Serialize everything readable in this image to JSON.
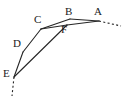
{
  "figure": {
    "background_color": "#ffffff",
    "stroke_color": "#262626",
    "label_color": "#1a1a1a",
    "stroke_width": 1.1,
    "viewbox": "0 0 125 99"
  },
  "vertices": [
    {
      "id": "A",
      "label": "A",
      "x": 99,
      "y": 21,
      "label_x": 94,
      "label_y": 6
    },
    {
      "id": "B",
      "label": "B",
      "x": 70,
      "y": 19,
      "label_x": 65,
      "label_y": 6
    },
    {
      "id": "C",
      "label": "C",
      "x": 41,
      "y": 29,
      "label_x": 34,
      "label_y": 14
    },
    {
      "id": "D",
      "label": "D",
      "x": 23,
      "y": 52,
      "label_x": 13,
      "label_y": 38
    },
    {
      "id": "E",
      "label": "E",
      "x": 14,
      "y": 77,
      "label_x": 3,
      "label_y": 68
    },
    {
      "id": "F",
      "label": "F",
      "x": 67,
      "y": 25,
      "label_x": 61,
      "label_y": 24
    }
  ],
  "edges": [
    {
      "id": "edge-A-B",
      "from": "A",
      "to": "B",
      "style": "solid"
    },
    {
      "id": "edge-B-C",
      "from": "B",
      "to": "C",
      "style": "solid"
    },
    {
      "id": "edge-C-D",
      "from": "C",
      "to": "D",
      "style": "solid"
    },
    {
      "id": "edge-D-E",
      "from": "D",
      "to": "E",
      "style": "solid"
    },
    {
      "id": "edge-A-F",
      "from": "A",
      "to": "F",
      "style": "solid"
    },
    {
      "id": "edge-F-C",
      "from": "F",
      "to": "C",
      "style": "solid"
    },
    {
      "id": "edge-E-F",
      "from": "E",
      "to": "F",
      "style": "solid"
    }
  ],
  "dashed_extensions": [
    {
      "id": "dash-right-of-A",
      "x1": 99,
      "y1": 21,
      "x2": 121,
      "y2": 26
    },
    {
      "id": "dash-below-E",
      "x1": 14,
      "y1": 77,
      "x2": 12,
      "y2": 96
    }
  ]
}
